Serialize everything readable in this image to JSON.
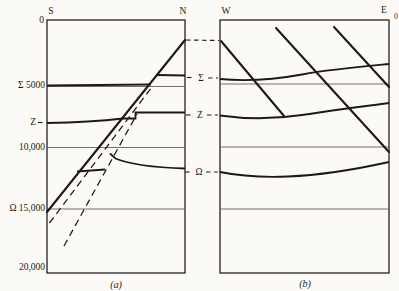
{
  "figure": {
    "description_colors": {
      "paper": "#fbfaf6",
      "ink": "#1d1a15",
      "grid": "#5a564e"
    },
    "labels": [
      {
        "name": "axis-top-label-s",
        "text": "S",
        "x": 51,
        "y": 14,
        "anchor": "middle",
        "cls": "txt"
      },
      {
        "name": "axis-top-label-n",
        "text": "N",
        "x": 183,
        "y": 14,
        "anchor": "middle",
        "cls": "txt"
      },
      {
        "name": "axis-top-label-w",
        "text": "W",
        "x": 226,
        "y": 14,
        "anchor": "middle",
        "cls": "txt"
      },
      {
        "name": "axis-top-label-e",
        "text": "E",
        "x": 384,
        "y": 13,
        "anchor": "middle",
        "cls": "txt"
      },
      {
        "name": "axis-top-label-e-zero",
        "text": "0",
        "x": 394,
        "y": 19,
        "anchor": "start",
        "cls": "txt txt-small"
      },
      {
        "name": "depth-tick-0",
        "text": "0",
        "x": 44,
        "y": 23,
        "anchor": "end",
        "cls": "txt"
      },
      {
        "name": "depth-tick-sigma-5000",
        "text": "Σ 5000",
        "x": 45,
        "y": 88,
        "anchor": "end",
        "cls": "txt"
      },
      {
        "name": "depth-tick-zeta",
        "text": "Ζ",
        "x": 36,
        "y": 125,
        "anchor": "end",
        "cls": "txt"
      },
      {
        "name": "depth-tick-10000",
        "text": "10,000",
        "x": 45,
        "y": 150,
        "anchor": "end",
        "cls": "txt"
      },
      {
        "name": "depth-tick-omega-15000",
        "text": "Ω 15,000",
        "x": 45,
        "y": 211,
        "anchor": "end",
        "cls": "txt"
      },
      {
        "name": "depth-tick-20000",
        "text": "20,000",
        "x": 45,
        "y": 270,
        "anchor": "end",
        "cls": "txt"
      },
      {
        "name": "horizon-label-sigma-mid",
        "text": "Σ",
        "x": 201,
        "y": 81,
        "anchor": "middle",
        "cls": "txt"
      },
      {
        "name": "horizon-label-zeta-mid",
        "text": "Ζ",
        "x": 200,
        "y": 118,
        "anchor": "middle",
        "cls": "txt"
      },
      {
        "name": "horizon-label-omega-mid",
        "text": "Ω",
        "x": 199,
        "y": 175,
        "anchor": "middle",
        "cls": "txt"
      },
      {
        "name": "panel-a-caption",
        "text": "(a)",
        "x": 116,
        "y": 288,
        "anchor": "middle",
        "cls": "txt txt-italic"
      },
      {
        "name": "panel-b-caption",
        "text": "(b)",
        "x": 305,
        "y": 287,
        "anchor": "middle",
        "cls": "txt txt-italic"
      }
    ],
    "shapes": [
      {
        "name": "panel-a-border",
        "type": "rect",
        "x": 47,
        "y": 20,
        "w": 138,
        "h": 253,
        "cls": "ink-border"
      },
      {
        "name": "panel-b-border",
        "type": "rect",
        "x": 220,
        "y": 20,
        "w": 169,
        "h": 253,
        "cls": "ink-border"
      },
      {
        "name": "panel-a-gridline-5000",
        "type": "path",
        "d": "M47 86.5 H185",
        "cls": "ink-grid"
      },
      {
        "name": "panel-a-gridline-10000",
        "type": "path",
        "d": "M47 147.5 H185",
        "cls": "ink-grid"
      },
      {
        "name": "panel-a-gridline-15000",
        "type": "path",
        "d": "M47 209 H185",
        "cls": "ink-grid"
      },
      {
        "name": "panel-b-gridline-5000",
        "type": "path",
        "d": "M220 84 H389",
        "cls": "ink-grid"
      },
      {
        "name": "panel-b-gridline-10000",
        "type": "path",
        "d": "M220 147 H389",
        "cls": "ink-grid"
      },
      {
        "name": "panel-b-gridline-15000",
        "type": "path",
        "d": "M220 209 H389",
        "cls": "ink-grid"
      },
      {
        "name": "panel-a-horizon-sigma-south",
        "type": "path",
        "d": "M47 85.5 L151 84.5",
        "cls": "ink-horizon"
      },
      {
        "name": "panel-a-horizon-sigma-north",
        "type": "path",
        "d": "M157 75 L185 75.5",
        "cls": "ink-horizon"
      },
      {
        "name": "panel-a-horizon-zeta",
        "type": "path",
        "d": "M47 123 C80 122.5 106 120.5 123 118.5 L135.5 118.5 L135.5 112.5 L185 112.5",
        "cls": "ink-horizon"
      },
      {
        "name": "panel-a-horizon-omega-sliver",
        "type": "path",
        "d": "M77 171.5 L105 169.5",
        "cls": "ink-horizon"
      },
      {
        "name": "panel-a-horizon-omega-north",
        "type": "path",
        "d": "M110 153.5 L115.5 158.5 C130 164.5 155 167.5 185 168.5",
        "cls": "ink-horizon"
      },
      {
        "name": "panel-a-fault-solid",
        "type": "path",
        "d": "M47 212 L185 40",
        "cls": "ink-fault"
      },
      {
        "name": "panel-a-fault-dashed-inner",
        "type": "path",
        "d": "M49.5 223 L153 85.5",
        "cls": "ink-fault-dashed"
      },
      {
        "name": "panel-a-fault-dashed-outer",
        "type": "path",
        "d": "M64 246 L137 114",
        "cls": "ink-fault-dashed"
      },
      {
        "name": "panel-b-horizon-sigma",
        "type": "path",
        "d": "M220 79 C245 81.5 272 80 302 74.5 C332 69 362 66.5 389 64",
        "cls": "ink-horizon"
      },
      {
        "name": "panel-b-horizon-zeta",
        "type": "path",
        "d": "M220 115.5 C248 119.5 272 119.5 302 115 C332 110.5 362 106.5 389 103",
        "cls": "ink-horizon"
      },
      {
        "name": "panel-b-horizon-omega",
        "type": "path",
        "d": "M220 172 C242 176.5 262 177.5 288 176.5 C325 175 362 168 389 162",
        "cls": "ink-horizon"
      },
      {
        "name": "panel-b-fault-west",
        "type": "path",
        "d": "M221 41 L284 116",
        "cls": "ink-fault"
      },
      {
        "name": "panel-b-fault-middle",
        "type": "path",
        "d": "M276 28 L389 152",
        "cls": "ink-fault"
      },
      {
        "name": "panel-b-fault-east",
        "type": "path",
        "d": "M334 27 L389 87",
        "cls": "ink-fault"
      },
      {
        "name": "connector-fault-top",
        "type": "path",
        "d": "M186 40 L219 40.5",
        "cls": "ink-connector"
      },
      {
        "name": "connector-sigma-left-dash",
        "type": "path",
        "d": "M187 77.5 H194",
        "cls": "ink-connector"
      },
      {
        "name": "connector-sigma-right-dash",
        "type": "path",
        "d": "M208 78 H218",
        "cls": "ink-connector"
      },
      {
        "name": "connector-zeta-left-dash",
        "type": "path",
        "d": "M186 115 H193",
        "cls": "ink-connector"
      },
      {
        "name": "connector-zeta-right-dash",
        "type": "path",
        "d": "M207 115 H218",
        "cls": "ink-connector"
      },
      {
        "name": "connector-omega-left-dash",
        "type": "path",
        "d": "M185 172 H192",
        "cls": "ink-connector"
      },
      {
        "name": "connector-omega-right-dash",
        "type": "path",
        "d": "M206 172 H218",
        "cls": "ink-connector"
      },
      {
        "name": "axis-zeta-tick-dash",
        "type": "path",
        "d": "M38 122.5 H46",
        "cls": "ink-connector"
      }
    ]
  },
  "chart_data": {
    "type": "table",
    "title": "",
    "note": "Two geological depth cross-sections sharing one depth scale",
    "depth_axis": {
      "tick_labels": [
        "0",
        "5000",
        "10,000",
        "15,000",
        "20,000"
      ],
      "min": 0,
      "max": 20000,
      "horizon_ticks": {
        "Σ": 5000,
        "Ζ": 8300,
        "Ω": 15000
      }
    },
    "sections": [
      {
        "caption": "(a)",
        "left_label": "S",
        "right_label": "N",
        "horizons": [
          "Σ",
          "Ζ",
          "Ω"
        ],
        "solid_diagonal_lines": 1,
        "dashed_diagonal_lines": 2
      },
      {
        "caption": "(b)",
        "left_label": "W",
        "right_label": "E",
        "right_sublabel": "0",
        "horizons": [
          "Σ",
          "Ζ",
          "Ω"
        ],
        "solid_diagonal_lines": 3,
        "dashed_diagonal_lines": 0
      }
    ]
  }
}
